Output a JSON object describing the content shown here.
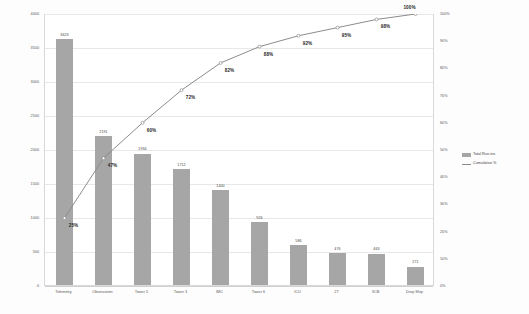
{
  "chart_data": {
    "type": "bar",
    "title": "",
    "subtitle": "",
    "xlabel": "",
    "ylabel": "",
    "y2label": "",
    "categories": [
      "Telemetry",
      "Observation",
      "Tower 5",
      "Tower 3",
      "IMC",
      "Tower 6",
      "ICU",
      "2T",
      "3CB",
      "Drop Ship"
    ],
    "series": [
      {
        "name": "Total Run-ins",
        "type": "bar",
        "color": "#a6a6a6",
        "values": [
          3623,
          2191,
          1934,
          1712,
          1400,
          926,
          586,
          476,
          463,
          271
        ]
      },
      {
        "name": "Cumulative %",
        "type": "line",
        "color": "#8c8c8c",
        "axis": "right",
        "values": [
          25,
          47,
          60,
          72,
          82,
          88,
          92,
          95,
          98,
          100
        ],
        "value_labels": [
          "25%",
          "47%",
          "60%",
          "72%",
          "82%",
          "88%",
          "92%",
          "95%",
          "98%",
          "100%"
        ]
      }
    ],
    "ylim": [
      0,
      4000
    ],
    "y2lim": [
      0,
      100
    ],
    "yticks": [
      0,
      500,
      1000,
      1500,
      2000,
      2500,
      3000,
      3500,
      4000
    ],
    "ytick_labels": [
      "0",
      "500",
      "1000",
      "1500",
      "2000",
      "2500",
      "3000",
      "3500",
      "4000"
    ],
    "y2ticks": [
      0,
      10,
      20,
      30,
      40,
      50,
      60,
      70,
      80,
      90,
      100
    ],
    "y2tick_labels": [
      "0%",
      "10%",
      "20%",
      "30%",
      "40%",
      "50%",
      "60%",
      "70%",
      "80%",
      "90%",
      "100%"
    ],
    "grid": true,
    "legend_position": "right",
    "legend": [
      "Total Run-ins",
      "Cumulative %"
    ]
  }
}
